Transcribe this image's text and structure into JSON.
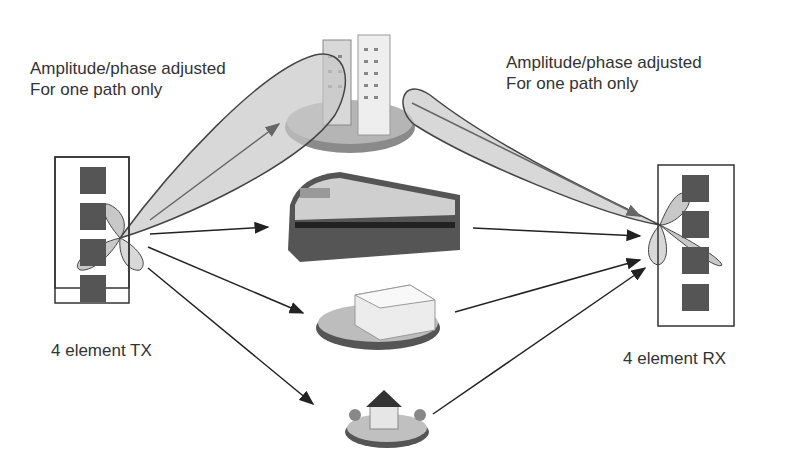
{
  "diagram": {
    "type": "MIMO multipath beamforming",
    "tx": {
      "label": "4 element TX",
      "elements": 4
    },
    "rx": {
      "label": "4 element RX",
      "elements": 4
    },
    "annotations": {
      "left": {
        "line1": "Amplitude/phase adjusted",
        "line2": "For one path only"
      },
      "right": {
        "line1": "Amplitude/phase adjusted",
        "line2": "For one path only"
      }
    },
    "scatterers": [
      {
        "name": "office-towers",
        "beamformed": true
      },
      {
        "name": "train",
        "beamformed": false
      },
      {
        "name": "office-building",
        "beamformed": false
      },
      {
        "name": "house",
        "beamformed": false
      }
    ],
    "colors": {
      "element": "#555555",
      "beam_fill": "#c8c8c8",
      "beam_stroke": "#444444",
      "arrow": "#222222",
      "text": "#333333"
    }
  }
}
